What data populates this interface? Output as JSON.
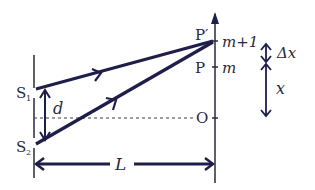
{
  "diagram": {
    "labels": {
      "s1": "S",
      "s1_sub": "1",
      "s2": "S",
      "s2_sub": "2",
      "d": "d",
      "o": "O",
      "p": "P",
      "p_prime": "P′",
      "m": "m",
      "m_plus_1": "m+1",
      "delta_x": "Δx",
      "x": "x",
      "L": "L"
    },
    "colors": {
      "ray": "#1e1e4a",
      "line": "#2a2a3a",
      "dashed": "#3a3a4a",
      "background": "#ffffff"
    }
  }
}
